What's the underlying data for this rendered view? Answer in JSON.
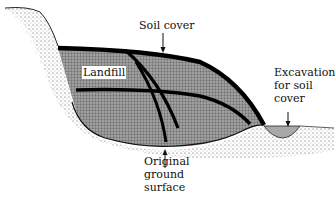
{
  "diagram": {
    "labels": {
      "soil_cover": "Soil cover",
      "landfill": "Landfill",
      "excavation_line1": "Excavation",
      "excavation_line2": "for soil",
      "excavation_line3": "cover",
      "original_line1": "Original",
      "original_line2": "ground",
      "original_line3": "surface"
    },
    "colors": {
      "landfill_fill": "#8a8a8a",
      "soil_stipple": "#555555",
      "cover_line": "#000000",
      "excavation_fill": "#a8a8a8",
      "background": "#ffffff"
    }
  }
}
